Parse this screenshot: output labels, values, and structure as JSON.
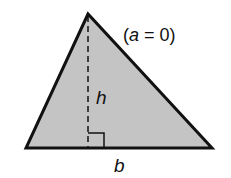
{
  "diagram": {
    "labels": {
      "height": "h",
      "base": "b",
      "condition_open": "(",
      "condition_var": "a",
      "condition_rest": " = 0)"
    },
    "colors": {
      "fill": "#c4c4c4",
      "stroke": "#111111"
    }
  }
}
